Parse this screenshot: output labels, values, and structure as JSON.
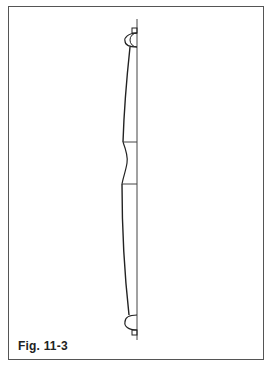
{
  "figure": {
    "caption": "Fig. 11-3",
    "colors": {
      "line": "#222222",
      "frame": "#555555",
      "background": "#ffffff"
    }
  }
}
